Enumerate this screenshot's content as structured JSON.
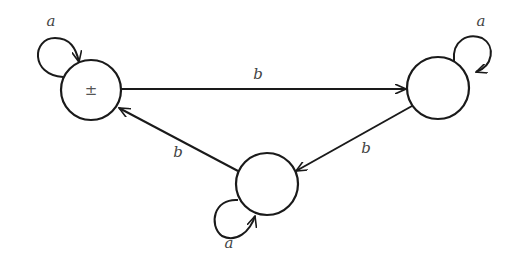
{
  "diagram": {
    "type": "finite-automaton",
    "states": [
      {
        "id": "s0",
        "label": "±",
        "start": true,
        "final": true
      },
      {
        "id": "s1",
        "label": ""
      },
      {
        "id": "s2",
        "label": ""
      }
    ],
    "transitions": [
      {
        "from": "s0",
        "to": "s0",
        "label": "a"
      },
      {
        "from": "s0",
        "to": "s1",
        "label": "b"
      },
      {
        "from": "s1",
        "to": "s1",
        "label": "a"
      },
      {
        "from": "s1",
        "to": "s2",
        "label": "b"
      },
      {
        "from": "s2",
        "to": "s2",
        "label": "a"
      },
      {
        "from": "s2",
        "to": "s0",
        "label": "b"
      }
    ],
    "colors": {
      "stroke": "#1a1a1a",
      "text": "#444444",
      "background": "#ffffff"
    }
  }
}
